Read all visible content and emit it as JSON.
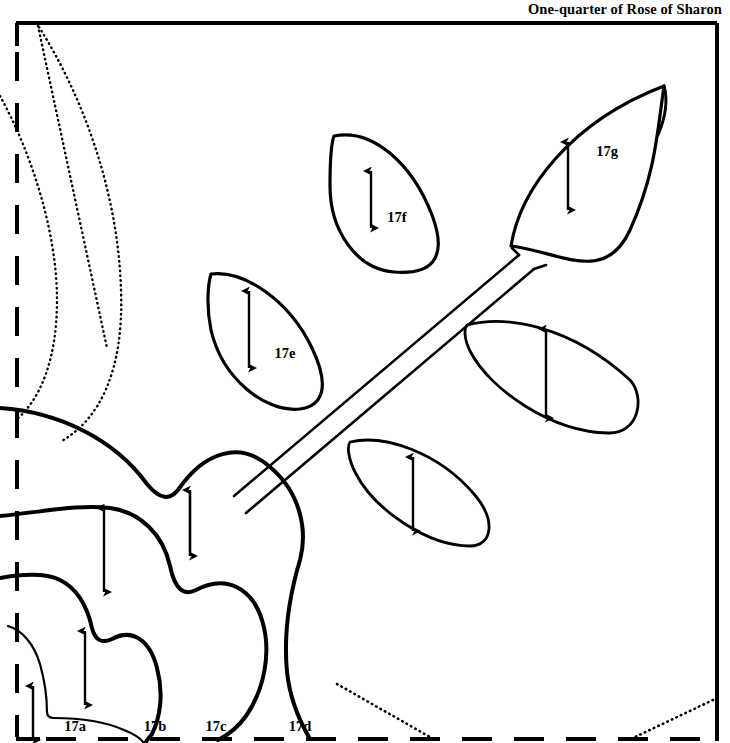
{
  "document": {
    "title": "One-quarter of Rose of Sharon",
    "title_position": "top-right",
    "background_color": "#ffffff",
    "ink_color": "#000000",
    "width": 730,
    "height": 743
  },
  "border": {
    "top_edge_style": "solid",
    "right_edge_style": "solid",
    "left_edge_style": "dashed-fold-line",
    "bottom_edge_style": "dashed-fold-line",
    "line_color": "#000000"
  },
  "pattern": {
    "kind": "applique-quilt-block-template",
    "motif": "Rose of Sharon",
    "fraction": "one-quarter"
  },
  "piece_labels": [
    {
      "id": "17a",
      "text": "17a",
      "x": 75,
      "y": 731,
      "kind": "petal"
    },
    {
      "id": "17b",
      "text": "17b",
      "x": 155,
      "y": 731,
      "kind": "petal"
    },
    {
      "id": "17c",
      "text": "17c",
      "x": 216,
      "y": 731,
      "kind": "petal"
    },
    {
      "id": "17d",
      "text": "17d",
      "x": 300,
      "y": 731,
      "kind": "petal"
    },
    {
      "id": "17e",
      "text": "17e",
      "x": 285,
      "y": 358,
      "kind": "leaf"
    },
    {
      "id": "17f",
      "text": "17f",
      "x": 397,
      "y": 222,
      "kind": "leaf"
    },
    {
      "id": "17g",
      "text": "17g",
      "x": 607,
      "y": 156,
      "kind": "leaf"
    }
  ],
  "grain_arrows": [
    {
      "name": "grain-arrow-17a",
      "x": 33,
      "y1": 686,
      "y2": 740
    },
    {
      "name": "grain-arrow-17b",
      "x": 85,
      "y1": 631,
      "y2": 705
    },
    {
      "name": "grain-arrow-17c",
      "x": 104,
      "y1": 508,
      "y2": 592
    },
    {
      "name": "grain-arrow-17d",
      "x": 190,
      "y1": 490,
      "y2": 556
    },
    {
      "name": "grain-arrow-17e",
      "x": 249,
      "y1": 291,
      "y2": 368
    },
    {
      "name": "grain-arrow-17f",
      "x": 371,
      "y1": 171,
      "y2": 228
    },
    {
      "name": "grain-arrow-17g",
      "x": 568,
      "y1": 142,
      "y2": 210
    },
    {
      "name": "grain-arrow-leaf-right",
      "x": 546,
      "y1": 329,
      "y2": 418
    },
    {
      "name": "grain-arrow-leaf-lower",
      "x": 413,
      "y1": 457,
      "y2": 531
    }
  ],
  "shapes": {
    "leaves": [
      {
        "name": "leaf-17g",
        "labeled": "17g"
      },
      {
        "name": "leaf-17f",
        "labeled": "17f"
      },
      {
        "name": "leaf-17e",
        "labeled": "17e"
      },
      {
        "name": "leaf-right-unlabeled",
        "labeled": ""
      },
      {
        "name": "leaf-lower-unlabeled",
        "labeled": ""
      }
    ],
    "stem": {
      "name": "stem",
      "style": "double-line-diagonal"
    },
    "petals": [
      {
        "name": "petal-17a"
      },
      {
        "name": "petal-17b"
      },
      {
        "name": "petal-17c"
      },
      {
        "name": "petal-17d"
      }
    ],
    "placement_guides": [
      {
        "name": "placement-guide-inner",
        "style": "dotted"
      },
      {
        "name": "placement-guide-outer",
        "style": "dotted"
      },
      {
        "name": "placement-guide-diagonal-top",
        "style": "dotted"
      },
      {
        "name": "placement-guide-diagonal-bottom",
        "style": "dotted"
      }
    ]
  }
}
